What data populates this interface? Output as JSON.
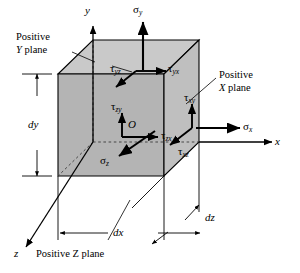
{
  "figure": {
    "type": "stress-element-diagram",
    "colors": {
      "face_front": "#b3b3b3",
      "face_top": "#c8c8c8",
      "face_right": "#bdbdbd",
      "outline": "#000000",
      "hidden_line": "#555555",
      "background": "#ffffff"
    }
  },
  "axes": [
    {
      "name": "y-axis",
      "label": "y"
    },
    {
      "name": "x-axis",
      "label": "x"
    },
    {
      "name": "z-axis",
      "label": "z"
    }
  ],
  "origin": {
    "label": "O"
  },
  "normal_stresses": [
    {
      "name": "sigma-y",
      "symbol": "σ",
      "subscript": "y",
      "direction": "up"
    },
    {
      "name": "sigma-x",
      "symbol": "σ",
      "subscript": "x",
      "direction": "right"
    },
    {
      "name": "sigma-z",
      "symbol": "σ",
      "subscript": "z",
      "direction": "down-left"
    }
  ],
  "shear_stresses": [
    {
      "name": "tau-yz",
      "symbol": "τ",
      "subscript": "yz",
      "face": "Positive Y plane"
    },
    {
      "name": "tau-yx",
      "symbol": "τ",
      "subscript": "yx",
      "face": "Positive Y plane"
    },
    {
      "name": "tau-zy",
      "symbol": "τ",
      "subscript": "zy",
      "face": "Positive Z plane"
    },
    {
      "name": "tau-zx",
      "symbol": "τ",
      "subscript": "zx",
      "face": "Positive Z plane"
    },
    {
      "name": "tau-xy",
      "symbol": "τ",
      "subscript": "xy",
      "face": "Positive X plane"
    },
    {
      "name": "tau-xz",
      "symbol": "τ",
      "subscript": "xz",
      "face": "Positive X plane"
    }
  ],
  "dimensions": [
    {
      "name": "dy",
      "label": "dy",
      "orientation": "vertical"
    },
    {
      "name": "dx",
      "label": "dx",
      "orientation": "horizontal"
    },
    {
      "name": "dz",
      "label": "dz",
      "orientation": "depth"
    }
  ],
  "callouts": [
    {
      "name": "positive-y-plane",
      "line1": "Positive",
      "line2_pre": "Y",
      "line2_post": " plane"
    },
    {
      "name": "positive-x-plane",
      "line1": "Positive",
      "line2_pre": "X",
      "line2_post": " plane"
    },
    {
      "name": "positive-z-plane",
      "line1": "",
      "line2_pre": "Positive Z",
      "line2_post": " plane"
    }
  ]
}
